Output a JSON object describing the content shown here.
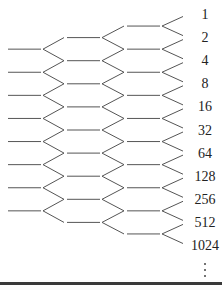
{
  "figure": {
    "labels": [
      "1",
      "2",
      "4",
      "8",
      "16",
      "32",
      "64",
      "128",
      "256",
      "512",
      "1024"
    ],
    "continuation": "⋮",
    "line_color": "#555555",
    "text_color": "#222222",
    "rule_color": "#3a3a3a"
  },
  "layout": {
    "label_y0": 15,
    "label_step": 23.1,
    "columns": [
      {
        "lead_x1": 8,
        "lead_x2": 41,
        "apex_x": 43,
        "arm_x": 64,
        "count": 8,
        "offset": 1.5
      },
      {
        "lead_x1": 67,
        "lead_x2": 100,
        "apex_x": 102,
        "arm_x": 124,
        "count": 9,
        "offset": 1.0
      },
      {
        "lead_x1": 127,
        "lead_x2": 160,
        "apex_x": 162,
        "arm_x": 183,
        "count": 10,
        "offset": 0.5
      }
    ]
  }
}
